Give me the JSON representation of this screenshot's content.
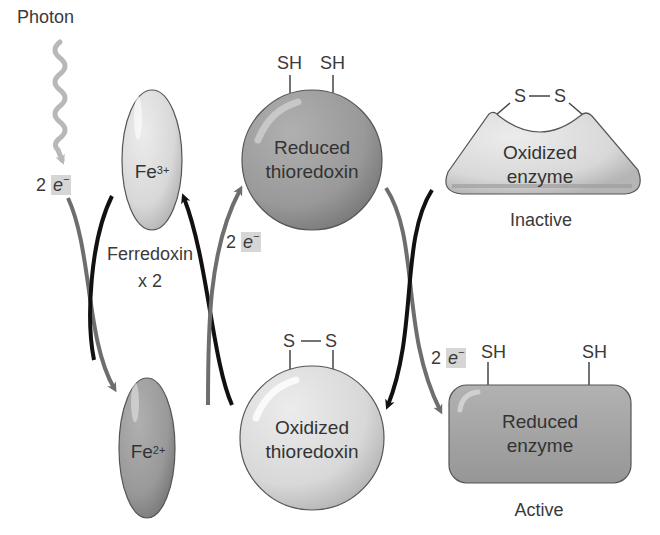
{
  "diagram": {
    "photon": {
      "label": "Photon"
    },
    "electron_labels": [
      {
        "id": "from-photon",
        "count": "2",
        "symbol": "e",
        "charge": "−"
      },
      {
        "id": "to-thioredoxin",
        "count": "2",
        "symbol": "e",
        "charge": "−"
      },
      {
        "id": "to-enzyme",
        "count": "2",
        "symbol": "e",
        "charge": "−"
      }
    ],
    "ferredoxin": {
      "label": "Ferredoxin",
      "multiplier": "x 2",
      "oxidized": {
        "symbol": "Fe",
        "charge": "3+"
      },
      "reduced": {
        "symbol": "Fe",
        "charge": "2+"
      }
    },
    "thioredoxin": {
      "reduced": {
        "line1": "Reduced",
        "line2": "thioredoxin",
        "groups": [
          "SH",
          "SH"
        ]
      },
      "oxidized": {
        "line1": "Oxidized",
        "line2": "thioredoxin",
        "bond": "S—S",
        "atoms": [
          "S",
          "S"
        ]
      }
    },
    "enzyme": {
      "oxidized": {
        "line1": "Oxidized",
        "line2": "enzyme",
        "state": "Inactive",
        "atoms": [
          "S",
          "S"
        ]
      },
      "reduced": {
        "line1": "Reduced",
        "line2": "enzyme",
        "state": "Active",
        "groups": [
          "SH",
          "SH"
        ]
      }
    },
    "colors": {
      "light_shape": "#dcdcdc",
      "dark_shape": "#9a9a9a",
      "arrow_gray": "#6e6e6e",
      "arrow_black": "#111111",
      "photon_wave": "#b8b8b8",
      "outline": "#555555"
    }
  }
}
